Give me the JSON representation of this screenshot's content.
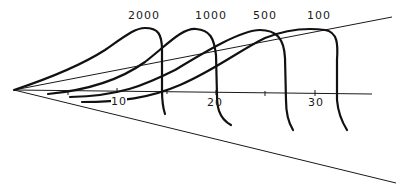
{
  "diagram": {
    "curve_labels": [
      "2000",
      "1000",
      "500",
      "100"
    ],
    "axis_tick_labels": [
      "10",
      "20",
      "30"
    ],
    "colors": {
      "line": "#111111",
      "background": "#ffffff"
    }
  }
}
